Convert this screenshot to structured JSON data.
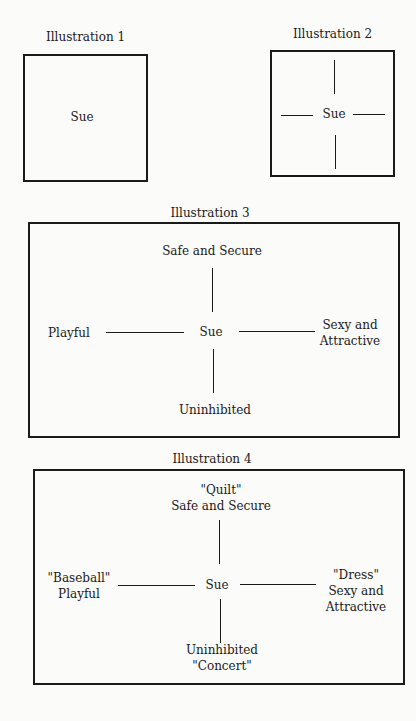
{
  "illustrations": [
    {
      "title": "Illustration 1",
      "center": "Sue"
    },
    {
      "title": "Illustration 2",
      "center": "Sue"
    },
    {
      "title": "Illustration 3",
      "center": "Sue",
      "top": "Safe and Secure",
      "left": "Playful",
      "right_line1": "Sexy and",
      "right_line2": "Attractive",
      "bottom": "Uninhibited"
    },
    {
      "title": "Illustration 4",
      "center": "Sue",
      "top_line1": "\"Quilt\"",
      "top_line2": "Safe and Secure",
      "left_line1": "\"Baseball\"",
      "left_line2": "Playful",
      "right_line1": "\"Dress\"",
      "right_line2": "Sexy and",
      "right_line3": "Attractive",
      "bottom_line1": "Uninhibited",
      "bottom_line2": "\"Concert\""
    }
  ]
}
